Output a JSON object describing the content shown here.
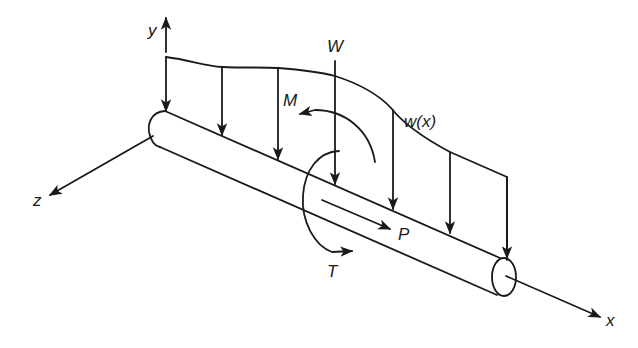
{
  "diagram": {
    "title": "",
    "type": "beam-loading-free-body-diagram",
    "axes": {
      "x": {
        "label": "x"
      },
      "y": {
        "label": "y"
      },
      "z": {
        "label": "z"
      }
    },
    "loads": {
      "distributed": {
        "label": "w(x)"
      },
      "point_force": {
        "label": "W"
      },
      "bending_moment": {
        "label": "M"
      },
      "torque": {
        "label": "T"
      },
      "axial_force": {
        "label": "P"
      }
    },
    "colors": {
      "stroke": "#1a1a1a",
      "background": "#ffffff"
    }
  }
}
